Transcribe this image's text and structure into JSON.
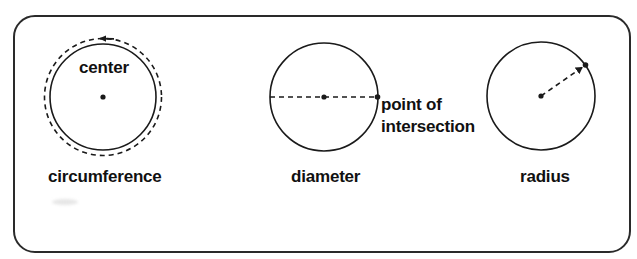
{
  "diagram": {
    "panels": [
      {
        "id": "circumference",
        "label": "circumference",
        "inner_label": "center",
        "elements": [
          "solid-circle",
          "dashed-outer-circle",
          "arrow-along-circumference",
          "center-dot"
        ]
      },
      {
        "id": "diameter",
        "label": "diameter",
        "annotation_line1": "point of",
        "annotation_line2": "intersection",
        "elements": [
          "solid-circle",
          "dashed-diameter-line",
          "center-dot",
          "intersection-dot"
        ]
      },
      {
        "id": "radius",
        "label": "radius",
        "elements": [
          "solid-circle",
          "dashed-radius-arrow",
          "center-dot",
          "endpoint-dot"
        ]
      }
    ],
    "colors": {
      "stroke": "#1a1a1a",
      "frame": "#2a2a2a",
      "background": "#ffffff"
    }
  }
}
